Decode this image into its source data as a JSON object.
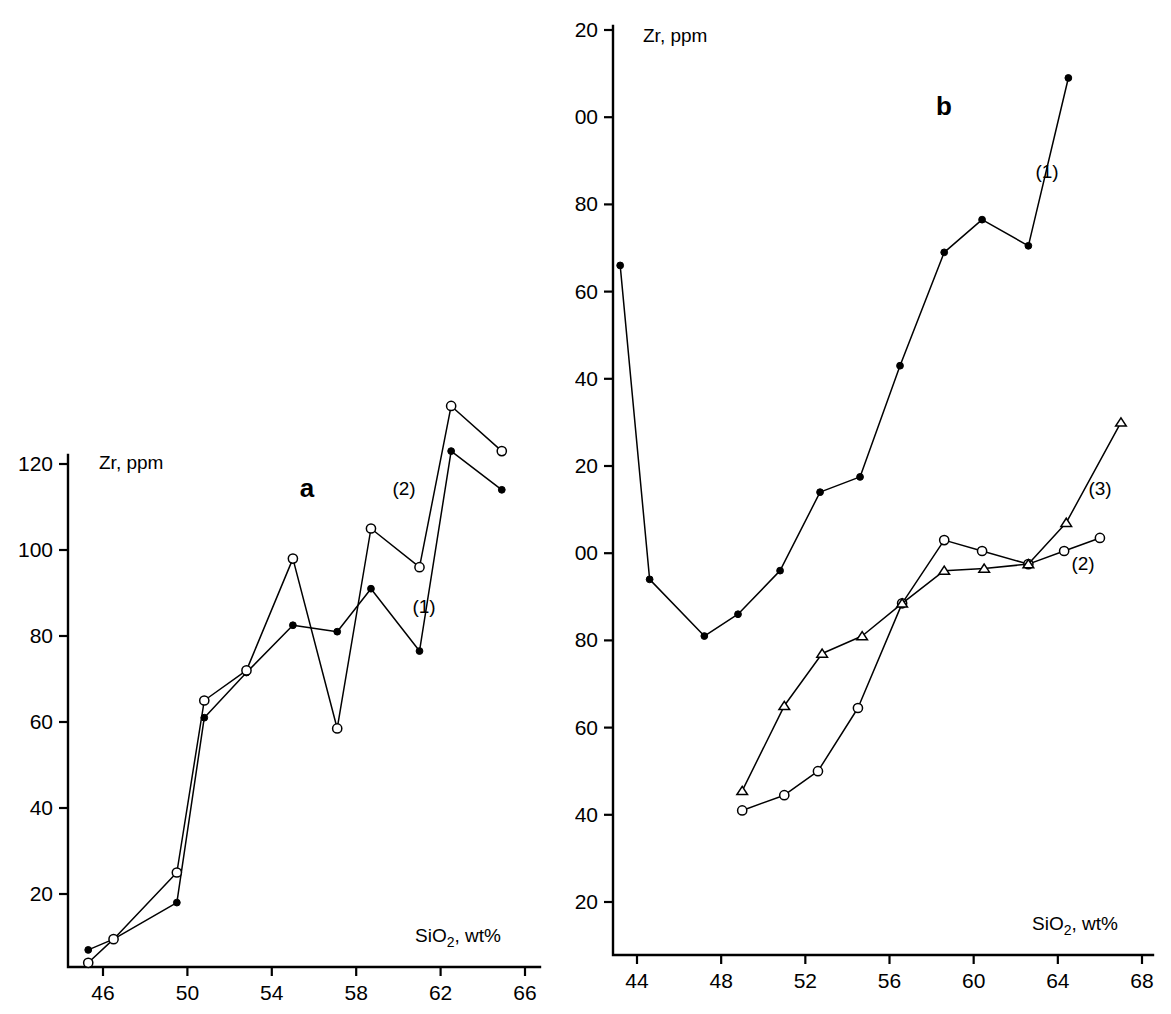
{
  "figure": {
    "background": "#ffffff",
    "ink_color": "#000000"
  },
  "panels": [
    {
      "id": "a",
      "letter": "a",
      "y_axis_title_main": "Zr",
      "y_axis_title_rest": ", ppm",
      "x_axis_title_main": "SiO",
      "x_axis_title_sub": "2",
      "x_axis_title_rest": ", wt%",
      "x_ticks": [
        "46",
        "50",
        "54",
        "58",
        "62",
        "66"
      ],
      "y_ticks": [
        "20",
        "40",
        "60",
        "80",
        "100",
        "120"
      ],
      "series_labels": [
        {
          "text": "(1)"
        },
        {
          "text": "(2)"
        }
      ]
    },
    {
      "id": "b",
      "letter": "b",
      "y_axis_title_main": "Zr",
      "y_axis_title_rest": ", ppm",
      "x_axis_title_main": "SiO",
      "x_axis_title_sub": "2",
      "x_axis_title_rest": ", wt%",
      "x_ticks": [
        "44",
        "48",
        "52",
        "56",
        "60",
        "64",
        "68"
      ],
      "y_ticks": [
        "20",
        "40",
        "60",
        "80",
        "100",
        "120",
        "140",
        "160",
        "180",
        "200",
        "220"
      ],
      "series_labels": [
        {
          "text": "(1)"
        },
        {
          "text": "(2)"
        },
        {
          "text": "(3)"
        }
      ]
    }
  ],
  "chart_data": [
    {
      "type": "line",
      "panel": "a",
      "title": "a",
      "xlabel": "SiO2, wt%",
      "ylabel": "Zr, ppm",
      "xlim": [
        44.6,
        66.5
      ],
      "ylim": [
        0,
        124
      ],
      "xticks": [
        46,
        50,
        54,
        58,
        62,
        66
      ],
      "yticks": [
        20,
        40,
        60,
        80,
        100,
        120
      ],
      "grid": false,
      "legend": "inline-annotation",
      "series": [
        {
          "name": "(1)",
          "marker": "filled-circle",
          "x": [
            45.3,
            46.5,
            49.5,
            50.8,
            52.8,
            55.0,
            57.1,
            58.7,
            61.0,
            62.5,
            64.9
          ],
          "y": [
            7.0,
            9.5,
            18.0,
            61.0,
            71.5,
            82.5,
            81.0,
            91.0,
            76.5,
            123.0,
            114.0
          ]
        },
        {
          "name": "(2)",
          "marker": "open-circle",
          "x": [
            45.3,
            46.5,
            49.5,
            50.8,
            52.8,
            55.0,
            57.1,
            58.7,
            61.0,
            62.5,
            64.9
          ],
          "y": [
            4.0,
            9.5,
            25.0,
            65.0,
            72.0,
            98.0,
            58.5,
            105.0,
            96.0,
            133.5,
            123.0
          ]
        }
      ]
    },
    {
      "type": "line",
      "panel": "b",
      "title": "b",
      "xlabel": "SiO2, wt%",
      "ylabel": "Zr, ppm",
      "xlim": [
        42.5,
        68.5
      ],
      "ylim": [
        0,
        224
      ],
      "xticks": [
        44,
        48,
        52,
        56,
        60,
        64,
        68
      ],
      "yticks": [
        20,
        40,
        60,
        80,
        100,
        120,
        140,
        160,
        180,
        200,
        220
      ],
      "grid": false,
      "legend": "inline-annotation",
      "series": [
        {
          "name": "(1)",
          "marker": "filled-circle",
          "x": [
            43.2,
            44.6,
            47.2,
            48.8,
            50.8,
            52.7,
            54.6,
            56.5,
            58.6,
            60.4,
            62.6,
            64.5
          ],
          "y": [
            166.0,
            94.0,
            81.0,
            86.0,
            96.0,
            114.0,
            117.5,
            143.0,
            169.0,
            176.5,
            170.5,
            209.0
          ]
        },
        {
          "name": "(2)",
          "marker": "open-circle",
          "x": [
            49.0,
            51.0,
            52.6,
            54.5,
            56.6,
            58.6,
            60.4,
            62.6,
            64.3,
            66.0
          ],
          "y": [
            41.0,
            44.5,
            50.0,
            64.5,
            88.5,
            103.0,
            100.5,
            97.5,
            100.5,
            103.5
          ]
        },
        {
          "name": "(3)",
          "marker": "open-triangle",
          "x": [
            49.0,
            51.0,
            52.8,
            54.7,
            56.6,
            58.6,
            60.5,
            62.6,
            64.4,
            67.0
          ],
          "y": [
            45.5,
            65.0,
            77.0,
            81.0,
            88.5,
            96.0,
            96.5,
            97.5,
            107.0,
            130.0
          ]
        }
      ]
    }
  ]
}
